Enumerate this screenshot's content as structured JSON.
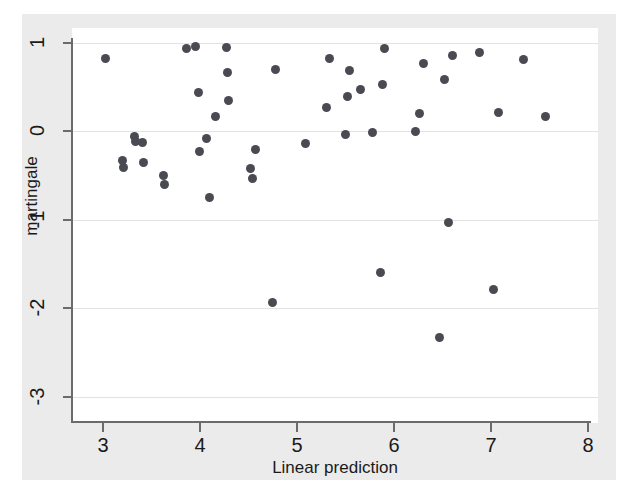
{
  "chart_data": {
    "type": "scatter",
    "title": "",
    "xlabel": "Linear prediction",
    "ylabel": "martingale",
    "xlim": [
      3,
      8
    ],
    "ylim": [
      -3,
      1
    ],
    "xticks": [
      3,
      4,
      5,
      6,
      7,
      8
    ],
    "yticks": [
      1,
      0,
      -1,
      -2,
      -3
    ],
    "xticklabels": [
      "3",
      "4",
      "5",
      "6",
      "7",
      "8"
    ],
    "yticklabels": [
      "1",
      "0",
      "-1",
      "-2",
      "-3"
    ],
    "grid": "horizontal",
    "legend": "none",
    "marker_color": "#4a4a52",
    "gridline_color": "#e2e2e2",
    "axis_color": "#6b6b6b",
    "page_background": "#ebebeb",
    "plot_background": "#ffffff",
    "points": [
      {
        "x": 3.03,
        "y": 0.82
      },
      {
        "x": 3.2,
        "y": -0.33
      },
      {
        "x": 3.21,
        "y": -0.41
      },
      {
        "x": 3.32,
        "y": -0.06
      },
      {
        "x": 3.33,
        "y": -0.12
      },
      {
        "x": 3.41,
        "y": -0.13
      },
      {
        "x": 3.42,
        "y": -0.36
      },
      {
        "x": 3.62,
        "y": -0.5
      },
      {
        "x": 3.63,
        "y": -0.61
      },
      {
        "x": 3.86,
        "y": 0.93
      },
      {
        "x": 3.95,
        "y": 0.96
      },
      {
        "x": 3.98,
        "y": 0.44
      },
      {
        "x": 3.99,
        "y": -0.23
      },
      {
        "x": 4.07,
        "y": -0.09
      },
      {
        "x": 4.1,
        "y": -0.75
      },
      {
        "x": 4.16,
        "y": 0.16
      },
      {
        "x": 4.27,
        "y": 0.94
      },
      {
        "x": 4.28,
        "y": 0.66
      },
      {
        "x": 4.29,
        "y": 0.34
      },
      {
        "x": 4.52,
        "y": -0.42
      },
      {
        "x": 4.54,
        "y": -0.54
      },
      {
        "x": 4.57,
        "y": -0.21
      },
      {
        "x": 4.75,
        "y": -1.94
      },
      {
        "x": 4.78,
        "y": 0.7
      },
      {
        "x": 5.09,
        "y": -0.14
      },
      {
        "x": 5.3,
        "y": 0.27
      },
      {
        "x": 5.33,
        "y": 0.82
      },
      {
        "x": 5.5,
        "y": -0.04
      },
      {
        "x": 5.52,
        "y": 0.39
      },
      {
        "x": 5.54,
        "y": 0.68
      },
      {
        "x": 5.65,
        "y": 0.47
      },
      {
        "x": 5.78,
        "y": -0.02
      },
      {
        "x": 5.86,
        "y": -1.6
      },
      {
        "x": 5.88,
        "y": 0.52
      },
      {
        "x": 5.9,
        "y": 0.93
      },
      {
        "x": 6.22,
        "y": -0.01
      },
      {
        "x": 6.26,
        "y": 0.2
      },
      {
        "x": 6.3,
        "y": 0.76
      },
      {
        "x": 6.47,
        "y": -2.33
      },
      {
        "x": 6.52,
        "y": 0.58
      },
      {
        "x": 6.56,
        "y": -1.03
      },
      {
        "x": 6.6,
        "y": 0.85
      },
      {
        "x": 6.88,
        "y": 0.89
      },
      {
        "x": 7.03,
        "y": -1.79
      },
      {
        "x": 7.08,
        "y": 0.21
      },
      {
        "x": 7.33,
        "y": 0.81
      },
      {
        "x": 7.56,
        "y": 0.16
      }
    ]
  }
}
